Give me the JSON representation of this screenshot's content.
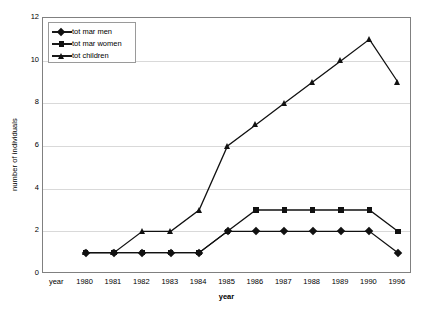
{
  "chart_data": {
    "type": "line",
    "title": "",
    "xlabel": "year",
    "ylabel": "number of individuals",
    "categories": [
      "year",
      "1980",
      "1981",
      "1982",
      "1983",
      "1984",
      "1985",
      "1986",
      "1987",
      "1988",
      "1989",
      "1990",
      "1996"
    ],
    "ylim": [
      0,
      12
    ],
    "yticks": [
      0,
      2,
      4,
      6,
      8,
      10,
      12
    ],
    "grid": true,
    "legend_position": "top-left",
    "series": [
      {
        "name": "tot mar men",
        "marker": "diamond",
        "color": "#111111",
        "x": [
          "1980",
          "1981",
          "1982",
          "1983",
          "1984",
          "1985",
          "1986",
          "1987",
          "1988",
          "1989",
          "1990",
          "1996"
        ],
        "values": [
          1,
          1,
          1,
          1,
          1,
          2,
          2,
          2,
          2,
          2,
          2,
          1
        ]
      },
      {
        "name": "tot mar women",
        "marker": "square",
        "color": "#111111",
        "x": [
          "1980",
          "1981",
          "1982",
          "1983",
          "1984",
          "1985",
          "1986",
          "1987",
          "1988",
          "1989",
          "1990",
          "1996"
        ],
        "values": [
          1,
          1,
          1,
          1,
          1,
          2,
          3,
          3,
          3,
          3,
          3,
          2
        ]
      },
      {
        "name": "tot children",
        "marker": "triangle",
        "color": "#111111",
        "x": [
          "1980",
          "1981",
          "1982",
          "1983",
          "1984",
          "1985",
          "1986",
          "1987",
          "1988",
          "1989",
          "1990",
          "1996"
        ],
        "values": [
          1,
          1,
          2,
          2,
          3,
          6,
          7,
          8,
          9,
          10,
          11,
          9
        ]
      }
    ]
  },
  "colors": {
    "plot_background": "#ffffff",
    "gridline": "#d9d9d9",
    "axis_border": "#808080",
    "series_line": "#111111",
    "text": "#000000"
  }
}
